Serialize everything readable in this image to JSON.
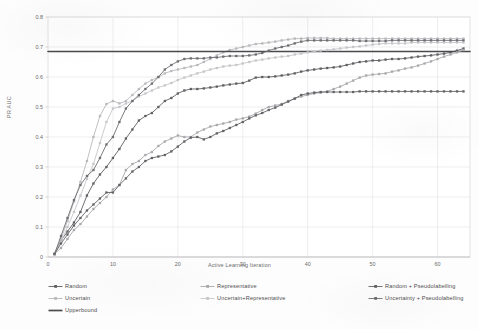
{
  "chart_data": {
    "type": "line",
    "title": "",
    "xlabel": "Active Learning Iteration",
    "ylabel": "PR AUC",
    "xlim": [
      0,
      65
    ],
    "ylim": [
      0,
      0.8
    ],
    "xticks": [
      0,
      10,
      20,
      30,
      40,
      50,
      60
    ],
    "xtick_labels": [
      "0",
      "10",
      "20",
      "30",
      "40",
      "50",
      "60"
    ],
    "yticks": [
      0,
      0.1,
      0.2,
      0.3,
      0.4,
      0.5,
      0.6,
      0.7,
      0.8
    ],
    "ytick_labels": [
      "0",
      "0.1",
      "0.2",
      "0.3",
      "0.4",
      "0.5",
      "0.6",
      "0.7",
      "0.8"
    ],
    "grid": true,
    "legend_position": "bottom",
    "marker": "square",
    "series": [
      {
        "name": "Random",
        "color": "#5f5f63",
        "x": [
          1,
          2,
          3,
          4,
          5,
          6,
          7,
          8,
          9,
          10,
          11,
          12,
          13,
          14,
          15,
          16,
          17,
          18,
          19,
          20,
          21,
          22,
          23,
          24,
          25,
          26,
          27,
          28,
          29,
          30,
          31,
          32,
          33,
          34,
          35,
          36,
          37,
          38,
          39,
          40,
          41,
          42,
          43,
          44,
          45,
          46,
          47,
          48,
          49,
          50,
          51,
          52,
          53,
          54,
          55,
          56,
          57,
          58,
          59,
          60,
          61,
          62,
          63,
          64
        ],
        "values": [
          0.01,
          0.055,
          0.085,
          0.115,
          0.15,
          0.205,
          0.245,
          0.275,
          0.3,
          0.33,
          0.36,
          0.395,
          0.425,
          0.455,
          0.47,
          0.48,
          0.5,
          0.52,
          0.53,
          0.545,
          0.555,
          0.56,
          0.56,
          0.562,
          0.565,
          0.568,
          0.572,
          0.575,
          0.578,
          0.58,
          0.588,
          0.598,
          0.6,
          0.6,
          0.602,
          0.605,
          0.608,
          0.612,
          0.618,
          0.622,
          0.625,
          0.628,
          0.63,
          0.632,
          0.635,
          0.64,
          0.645,
          0.65,
          0.652,
          0.655,
          0.655,
          0.658,
          0.66,
          0.66,
          0.662,
          0.665,
          0.668,
          0.67,
          0.672,
          0.675,
          0.678,
          0.682,
          0.688,
          0.695
        ]
      },
      {
        "name": "Uncertain",
        "color": "#b9b9bd",
        "x": [
          1,
          2,
          3,
          4,
          5,
          6,
          7,
          8,
          9,
          10,
          11,
          12,
          13,
          14,
          15,
          16,
          17,
          18,
          19,
          20,
          21,
          22,
          23,
          24,
          25,
          26,
          27,
          28,
          29,
          30,
          31,
          32,
          33,
          34,
          35,
          36,
          37,
          38,
          39,
          40,
          41,
          42,
          43,
          44,
          45,
          46,
          47,
          48,
          49,
          50,
          51,
          52,
          53,
          54,
          55,
          56,
          57,
          58,
          59,
          60,
          61,
          62,
          63,
          64
        ],
        "values": [
          0.01,
          0.06,
          0.12,
          0.185,
          0.25,
          0.32,
          0.4,
          0.47,
          0.51,
          0.52,
          0.512,
          0.52,
          0.54,
          0.56,
          0.578,
          0.59,
          0.6,
          0.612,
          0.62,
          0.625,
          0.63,
          0.635,
          0.64,
          0.65,
          0.66,
          0.672,
          0.682,
          0.69,
          0.695,
          0.7,
          0.705,
          0.71,
          0.712,
          0.715,
          0.718,
          0.722,
          0.725,
          0.728,
          0.728,
          0.73,
          0.73,
          0.73,
          0.73,
          0.728,
          0.728,
          0.728,
          0.728,
          0.728,
          0.728,
          0.728,
          0.728,
          0.728,
          0.728,
          0.728,
          0.728,
          0.728,
          0.728,
          0.728,
          0.728,
          0.728,
          0.728,
          0.728,
          0.728,
          0.728
        ]
      },
      {
        "name": "Upperbound",
        "color": "#4a4a4e",
        "x": [
          0,
          65
        ],
        "values": [
          0.685,
          0.685
        ],
        "style": "flat-line",
        "marker": "none"
      },
      {
        "name": "Representative",
        "color": "#a9a9ad",
        "x": [
          1,
          2,
          3,
          4,
          5,
          6,
          7,
          8,
          9,
          10,
          11,
          12,
          13,
          14,
          15,
          16,
          17,
          18,
          19,
          20,
          21,
          22,
          23,
          24,
          25,
          26,
          27,
          28,
          29,
          30,
          31,
          32,
          33,
          34,
          35,
          36,
          37,
          38,
          39,
          40,
          41,
          42,
          43,
          44,
          45,
          46,
          47,
          48,
          49,
          50,
          51,
          52,
          53,
          54,
          55,
          56,
          57,
          58,
          59,
          60,
          61,
          62,
          63,
          64
        ],
        "values": [
          0.01,
          0.03,
          0.06,
          0.09,
          0.11,
          0.135,
          0.16,
          0.18,
          0.2,
          0.225,
          0.24,
          0.29,
          0.31,
          0.32,
          0.34,
          0.35,
          0.37,
          0.385,
          0.395,
          0.405,
          0.4,
          0.4,
          0.415,
          0.425,
          0.435,
          0.44,
          0.445,
          0.45,
          0.458,
          0.462,
          0.468,
          0.478,
          0.49,
          0.5,
          0.505,
          0.51,
          0.52,
          0.528,
          0.535,
          0.54,
          0.545,
          0.548,
          0.552,
          0.56,
          0.568,
          0.578,
          0.588,
          0.598,
          0.605,
          0.608,
          0.61,
          0.612,
          0.618,
          0.622,
          0.628,
          0.632,
          0.638,
          0.645,
          0.652,
          0.66,
          0.668,
          0.675,
          0.682,
          0.69
        ]
      },
      {
        "name": "Uncertain+Representative",
        "color": "#c6c6ca",
        "x": [
          1,
          2,
          3,
          4,
          5,
          6,
          7,
          8,
          9,
          10,
          11,
          12,
          13,
          14,
          15,
          16,
          17,
          18,
          19,
          20,
          21,
          22,
          23,
          24,
          25,
          26,
          27,
          28,
          29,
          30,
          31,
          32,
          33,
          34,
          35,
          36,
          37,
          38,
          39,
          40,
          41,
          42,
          43,
          44,
          45,
          46,
          47,
          48,
          49,
          50,
          51,
          52,
          53,
          54,
          55,
          56,
          57,
          58,
          59,
          60,
          61,
          62,
          63,
          64
        ],
        "values": [
          0.01,
          0.05,
          0.1,
          0.15,
          0.205,
          0.26,
          0.31,
          0.38,
          0.45,
          0.495,
          0.5,
          0.512,
          0.52,
          0.535,
          0.545,
          0.555,
          0.565,
          0.572,
          0.58,
          0.59,
          0.598,
          0.605,
          0.612,
          0.618,
          0.625,
          0.63,
          0.635,
          0.638,
          0.64,
          0.645,
          0.65,
          0.655,
          0.658,
          0.662,
          0.665,
          0.668,
          0.67,
          0.675,
          0.678,
          0.682,
          0.685,
          0.688,
          0.69,
          0.692,
          0.695,
          0.698,
          0.7,
          0.702,
          0.705,
          0.708,
          0.71,
          0.712,
          0.712,
          0.712,
          0.712,
          0.715,
          0.715,
          0.715,
          0.715,
          0.715,
          0.715,
          0.715,
          0.715,
          0.715
        ]
      },
      {
        "name": "Random + Pseudolabelling",
        "color": "#636367",
        "x": [
          1,
          2,
          3,
          4,
          5,
          6,
          7,
          8,
          9,
          10,
          11,
          12,
          13,
          14,
          15,
          16,
          17,
          18,
          19,
          20,
          21,
          22,
          23,
          24,
          25,
          26,
          27,
          28,
          29,
          30,
          31,
          32,
          33,
          34,
          35,
          36,
          37,
          38,
          39,
          40,
          41,
          42,
          43,
          44,
          45,
          46,
          47,
          48,
          49,
          50,
          51,
          52,
          53,
          54,
          55,
          56,
          57,
          58,
          59,
          60,
          61,
          62,
          63,
          64
        ],
        "values": [
          0.01,
          0.045,
          0.075,
          0.105,
          0.13,
          0.155,
          0.175,
          0.195,
          0.215,
          0.215,
          0.24,
          0.262,
          0.285,
          0.3,
          0.32,
          0.33,
          0.335,
          0.34,
          0.352,
          0.368,
          0.385,
          0.398,
          0.4,
          0.392,
          0.4,
          0.412,
          0.42,
          0.43,
          0.44,
          0.45,
          0.462,
          0.472,
          0.48,
          0.49,
          0.498,
          0.508,
          0.518,
          0.528,
          0.54,
          0.545,
          0.548,
          0.55,
          0.55,
          0.55,
          0.55,
          0.55,
          0.55,
          0.552,
          0.552,
          0.552,
          0.552,
          0.552,
          0.552,
          0.552,
          0.552,
          0.552,
          0.552,
          0.552,
          0.552,
          0.552,
          0.552,
          0.552,
          0.552,
          0.552
        ]
      },
      {
        "name": "Uncertainty + Pseudolabelling",
        "color": "#6e6e72",
        "x": [
          1,
          2,
          3,
          4,
          5,
          6,
          7,
          8,
          9,
          10,
          11,
          12,
          13,
          14,
          15,
          16,
          17,
          18,
          19,
          20,
          21,
          22,
          23,
          24,
          25,
          26,
          27,
          28,
          29,
          30,
          31,
          32,
          33,
          34,
          35,
          36,
          37,
          38,
          39,
          40,
          41,
          42,
          43,
          44,
          45,
          46,
          47,
          48,
          49,
          50,
          51,
          52,
          53,
          54,
          55,
          56,
          57,
          58,
          59,
          60,
          61,
          62,
          63,
          64
        ],
        "values": [
          0.01,
          0.07,
          0.13,
          0.19,
          0.24,
          0.27,
          0.29,
          0.33,
          0.375,
          0.4,
          0.45,
          0.495,
          0.52,
          0.54,
          0.56,
          0.578,
          0.6,
          0.625,
          0.64,
          0.652,
          0.66,
          0.662,
          0.662,
          0.662,
          0.665,
          0.665,
          0.668,
          0.67,
          0.67,
          0.67,
          0.672,
          0.675,
          0.68,
          0.688,
          0.695,
          0.7,
          0.705,
          0.712,
          0.718,
          0.722,
          0.722,
          0.722,
          0.722,
          0.722,
          0.722,
          0.722,
          0.722,
          0.72,
          0.72,
          0.72,
          0.72,
          0.72,
          0.722,
          0.722,
          0.722,
          0.722,
          0.722,
          0.722,
          0.722,
          0.722,
          0.722,
          0.722,
          0.722,
          0.722
        ]
      }
    ]
  },
  "legend": {
    "columns": [
      [
        {
          "label": "Random",
          "color": "#5f5f63",
          "marker": "square"
        },
        {
          "label": "Uncertain",
          "color": "#b9b9bd",
          "marker": "square"
        },
        {
          "label": "Upperbound",
          "color": "#4a4a4e",
          "marker": "none"
        }
      ],
      [
        {
          "label": "Representative",
          "color": "#a9a9ad",
          "marker": "square"
        },
        {
          "label": "Uncertain+Representative",
          "color": "#c6c6ca",
          "marker": "square"
        }
      ],
      [
        {
          "label": "Random + Pseudolabelling",
          "color": "#636367",
          "marker": "square"
        },
        {
          "label": "Uncertainty + Pseudolabelling",
          "color": "#6e6e72",
          "marker": "square"
        }
      ]
    ]
  },
  "axes": {
    "x_title": "Active Learning Iteration",
    "y_title": "PR AUC"
  }
}
